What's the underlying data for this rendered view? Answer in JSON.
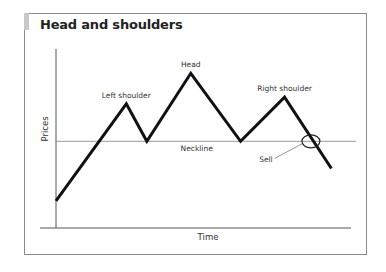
{
  "title": "Head and shoulders",
  "axes": {
    "x_label": "Time",
    "y_label": "Prices"
  },
  "colors": {
    "price_line": "#111111",
    "neckline": "#999999",
    "axis": "#555555",
    "frame": "#8a8a8a",
    "accent": "#c8c8c8"
  },
  "chart_data": {
    "type": "line",
    "title": "Head and shoulders",
    "xlabel": "Time",
    "ylabel": "Prices",
    "x_range": [
      0,
      100
    ],
    "y_range": [
      0,
      100
    ],
    "grid": false,
    "series": [
      {
        "name": "Price",
        "points": [
          {
            "x": 0,
            "y": 16
          },
          {
            "x": 24,
            "y": 73
          },
          {
            "x": 31,
            "y": 51
          },
          {
            "x": 46,
            "y": 91
          },
          {
            "x": 63,
            "y": 51
          },
          {
            "x": 78,
            "y": 77
          },
          {
            "x": 94,
            "y": 35
          }
        ]
      }
    ],
    "neckline": {
      "y": 51,
      "label": "Neckline"
    },
    "annotations": [
      {
        "text": "Left shoulder",
        "x": 24,
        "y": 73
      },
      {
        "text": "Head",
        "x": 46,
        "y": 91
      },
      {
        "text": "Right shoulder",
        "x": 78,
        "y": 77
      },
      {
        "text": "Neckline",
        "x": 47,
        "y": 51
      },
      {
        "text": "Sell",
        "x": 87,
        "y": 51,
        "marker": "circle"
      }
    ]
  }
}
